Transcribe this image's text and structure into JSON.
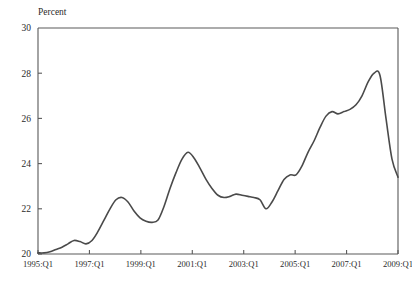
{
  "chart_data": {
    "type": "line",
    "title": "",
    "subtitle": "",
    "unit_label": "Percent",
    "xlabel": "",
    "ylabel": "Percent",
    "ylim": [
      20,
      30
    ],
    "yticks": [
      20,
      22,
      24,
      26,
      28,
      30
    ],
    "ytick_labels": [
      "20",
      "22",
      "24",
      "26",
      "28",
      "30"
    ],
    "xlim": [
      "1995:Q1",
      "2009:Q1"
    ],
    "xticks": [
      "1995:Q1",
      "1997:Q1",
      "1999:Q1",
      "2001:Q1",
      "2003:Q1",
      "2005:Q1",
      "2007:Q1",
      "2009:Q1"
    ],
    "xtick_labels": [
      "1995:Q1",
      "1997:Q1",
      "1999:Q1",
      "2001:Q1",
      "2003:Q1",
      "2005:Q1",
      "2007:Q1",
      "2009:Q1"
    ],
    "grid": false,
    "legend": false,
    "legend_position": "none",
    "line_color": "#4a4a4a",
    "axis_color": "#5a5a5a",
    "background_color": "#ffffff",
    "x": [
      "1995:Q1",
      "1995:Q2",
      "1995:Q3",
      "1995:Q4",
      "1996:Q1",
      "1996:Q2",
      "1996:Q3",
      "1996:Q4",
      "1997:Q1",
      "1997:Q2",
      "1997:Q3",
      "1997:Q4",
      "1998:Q1",
      "1998:Q2",
      "1998:Q3",
      "1998:Q4",
      "1999:Q1",
      "1999:Q2",
      "1999:Q3",
      "1999:Q4",
      "2000:Q1",
      "2000:Q2",
      "2000:Q3",
      "2000:Q4",
      "2001:Q1",
      "2001:Q2",
      "2001:Q3",
      "2001:Q4",
      "2002:Q1",
      "2002:Q2",
      "2002:Q3",
      "2002:Q4",
      "2003:Q1",
      "2003:Q2",
      "2003:Q3",
      "2003:Q4",
      "2004:Q1",
      "2004:Q2",
      "2004:Q3",
      "2004:Q4",
      "2005:Q1",
      "2005:Q2",
      "2005:Q3",
      "2005:Q4",
      "2006:Q1",
      "2006:Q2",
      "2006:Q3",
      "2006:Q4",
      "2007:Q1",
      "2007:Q2",
      "2007:Q3",
      "2007:Q4",
      "2008:Q1",
      "2008:Q2",
      "2008:Q3",
      "2008:Q4",
      "2009:Q1"
    ],
    "series": [
      {
        "name": "Percent",
        "values": [
          20.05,
          20.05,
          20.1,
          20.2,
          20.3,
          20.45,
          20.6,
          20.55,
          20.45,
          20.6,
          21.0,
          21.5,
          22.0,
          22.4,
          22.5,
          22.3,
          21.9,
          21.6,
          21.45,
          21.4,
          21.5,
          22.1,
          22.9,
          23.6,
          24.2,
          24.5,
          24.25,
          23.8,
          23.3,
          22.9,
          22.6,
          22.5,
          22.55,
          22.65,
          22.6,
          22.55,
          22.5,
          22.4,
          22.0,
          22.3,
          22.8,
          23.3,
          23.5,
          23.5,
          23.9,
          24.5,
          25.0,
          25.6,
          26.1,
          26.3,
          26.2,
          26.3,
          26.4,
          26.6,
          27.0,
          27.6,
          28.0
        ],
        "values_tail": [
          27.9,
          26.0,
          24.2,
          23.4
        ]
      }
    ],
    "annotations": []
  },
  "plot_geometry": {
    "left": 38,
    "right": 398,
    "top": 28,
    "bottom": 254
  }
}
